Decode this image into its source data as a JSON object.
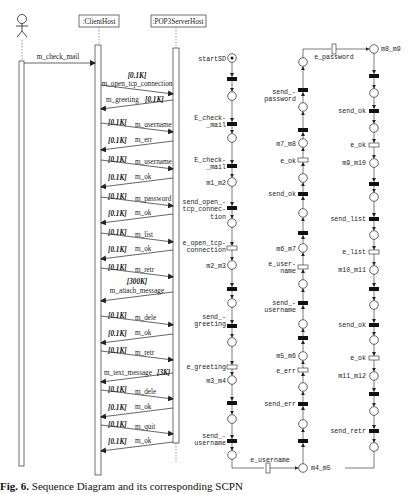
{
  "sequence_diagram": {
    "actor": {
      "name": "user-actor"
    },
    "objects": [
      {
        "label": ":ClientHost"
      },
      {
        "label": ":POP3ServerHost"
      }
    ],
    "actor_message": {
      "label": "m_check_mail"
    },
    "messages": [
      {
        "label": "m_open_tcp_connection",
        "size": "[0.1K]",
        "dir": "right"
      },
      {
        "label": "m_greeting",
        "size": "[0.1K]",
        "dir": "left"
      },
      {
        "label": "m_username",
        "size": "[0.1K]",
        "dir": "right"
      },
      {
        "label": "m_err",
        "size": "[0.1K]",
        "dir": "left"
      },
      {
        "label": "m_username",
        "size": "[0.1K]",
        "dir": "right"
      },
      {
        "label": "m_ok",
        "size": "[0.1K]",
        "dir": "left"
      },
      {
        "label": "m_password",
        "size": "[0.1K]",
        "dir": "right"
      },
      {
        "label": "m_ok",
        "size": "[0.1K]",
        "dir": "left"
      },
      {
        "label": "m_list",
        "size": "[0.1K]",
        "dir": "right"
      },
      {
        "label": "m_ok",
        "size": "[0.1K]",
        "dir": "left"
      },
      {
        "label": "m_retr",
        "size": "[0.1K]",
        "dir": "right"
      },
      {
        "label": "m_attach_message",
        "size": "[300K]",
        "dir": "left"
      },
      {
        "label": "m_dele",
        "size": "[0.1K]",
        "dir": "right"
      },
      {
        "label": "m_ok",
        "size": "[0.1K]",
        "dir": "left"
      },
      {
        "label": "m_retr",
        "size": "[0.1K]",
        "dir": "right"
      },
      {
        "label": "m_text_message",
        "size": "[3K]",
        "dir": "left"
      },
      {
        "label": "m_dele",
        "size": "[0.1K]",
        "dir": "right"
      },
      {
        "label": "m_ok",
        "size": "[0.1K]",
        "dir": "left"
      },
      {
        "label": "m_quit",
        "size": "[0.1K]",
        "dir": "right"
      },
      {
        "label": "m_ok",
        "size": "[0.1K]",
        "dir": "left"
      }
    ]
  },
  "petri_net": {
    "col1": {
      "start": "startSD",
      "labels": [
        "E_check-\n_mail",
        "E_check-\n_mail",
        "m1_m2",
        "send_open_-\ntcp_connec-\ntion",
        "e_open_tcp-\nconnection",
        "m2_m3",
        "send_-\ngreeting",
        "e_greeting",
        "m3_m4",
        "send_-\nusername"
      ]
    },
    "col2": {
      "labels": [
        "send_-\npassword",
        "m7_m8",
        "e_ok",
        "send_ok",
        "m6_m7",
        "e_user-\nname",
        "send_-\nusername",
        "m5_m6",
        "e_err",
        "send_err",
        "m4_m5"
      ]
    },
    "col3": {
      "labels": [
        "m8_m9",
        "send_ok",
        "e_ok",
        "m9_m10",
        "send_list",
        "e_list",
        "m10_m11",
        "send_ok",
        "e_ok",
        "m11_m12",
        "send_retr",
        "e_retr"
      ]
    },
    "col4": {
      "labels": [
        "...",
        "send_retr",
        "m15_m16",
        "e_ok",
        "send_ok",
        "m14_m15",
        "e_dele",
        "send_dele",
        "m13_m14",
        "e_attach-\n_message",
        "send_-\nattach-\n_message",
        "m12_m13"
      ]
    },
    "connectors": {
      "e_username": "e_username",
      "e_password": "e_password",
      "e_retr": "e_retr"
    }
  },
  "caption": {
    "prefix": "Fig. 6.",
    "text": "Sequence Diagram and its corresponding SCPN"
  }
}
